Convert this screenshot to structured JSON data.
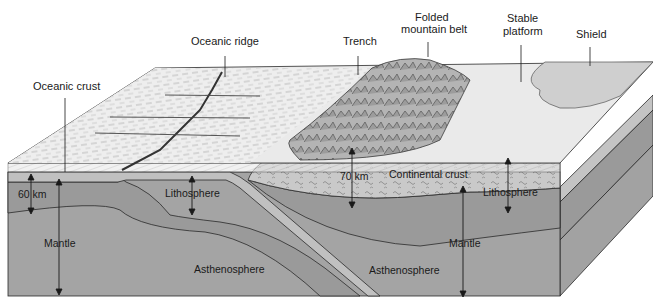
{
  "diagram": {
    "type": "geologic-block-diagram",
    "colors": {
      "surface_ocean": "#ececec",
      "surface_platform": "#e6e6e6",
      "shield": "#cfcfcf",
      "mountains": "#a9a9a9",
      "continental_crust": "#c9c9c9",
      "oceanic_crust_band": "#cdcdcd",
      "lithosphere": "#9a9a9a",
      "asthenosphere": "#a4a4a4",
      "side_face": "#8f8f8f",
      "outline": "#2a2a2a"
    },
    "surface_labels": {
      "oceanic_crust": "Oceanic crust",
      "oceanic_ridge": "Oceanic ridge",
      "trench": "Trench",
      "folded_mountain_belt_line1": "Folded",
      "folded_mountain_belt_line2": "mountain belt",
      "stable_platform_line1": "Stable",
      "stable_platform_line2": "platform",
      "shield": "Shield"
    },
    "section_labels": {
      "depth_oceanic": "60 km",
      "mantle_left": "Mantle",
      "lithosphere_left": "Lithosphere",
      "asthenosphere_left": "Asthenosphere",
      "depth_continental": "70 km",
      "continental_crust": "Continental crust",
      "lithosphere_right": "Lithosphere",
      "mantle_right": "Mantle",
      "asthenosphere_right": "Asthenosphere"
    }
  }
}
